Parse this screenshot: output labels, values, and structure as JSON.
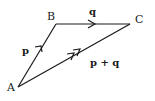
{
  "diagram": {
    "type": "vector-triangle",
    "points": {
      "A": {
        "label": "A"
      },
      "B": {
        "label": "B"
      },
      "C": {
        "label": "C"
      }
    },
    "vectors": [
      {
        "from": "A",
        "to": "B",
        "label": "p",
        "arrowheads": 1
      },
      {
        "from": "B",
        "to": "C",
        "label": "q",
        "arrowheads": 1
      },
      {
        "from": "A",
        "to": "C",
        "label": "p + q",
        "arrowheads": 2
      }
    ],
    "colors": {
      "stroke": "#1a1a1a",
      "background": "#ffffff"
    }
  }
}
